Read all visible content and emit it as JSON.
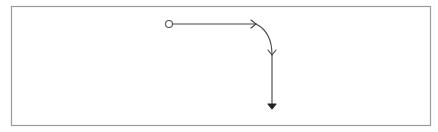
{
  "diagram": {
    "type": "flow-path",
    "frame": {
      "x": 11,
      "y": 6,
      "width": 419,
      "height": 119,
      "stroke": "#9a9a9a",
      "fill": "#ffffff"
    },
    "stroke_color": "#444444",
    "start_node": {
      "shape": "open-circle",
      "cx": 169,
      "cy": 24,
      "r": 3.5
    },
    "segments": [
      {
        "id": "horizontal",
        "kind": "line",
        "from": [
          173,
          24
        ],
        "to": [
          256,
          24
        ],
        "end_marker": "open-chevron"
      },
      {
        "id": "bend",
        "kind": "curve",
        "from": [
          256,
          24
        ],
        "to": [
          272,
          55
        ],
        "end_marker": "open-chevron"
      },
      {
        "id": "vertical",
        "kind": "line",
        "from": [
          272,
          55
        ],
        "to": [
          272,
          106
        ],
        "end_marker": "filled-triangle"
      }
    ],
    "labels": []
  }
}
